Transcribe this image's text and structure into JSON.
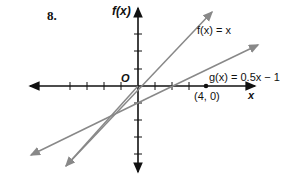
{
  "problem_number": "8.",
  "axes": {
    "y_label": "f(x)",
    "x_label": "x",
    "origin_label": "O"
  },
  "lines": [
    {
      "name": "f",
      "label": "f(x) = x",
      "slope": 1,
      "intercept": 0,
      "color": "#888888"
    },
    {
      "name": "g",
      "label": "g(x) = 0.5x − 1",
      "slope": 0.5,
      "intercept": -1,
      "color": "#888888"
    }
  ],
  "points": [
    {
      "label": "(4, 0)",
      "x": 4,
      "y": 0
    }
  ],
  "grid": {
    "unit_px": 17,
    "x_ticks": [
      -4,
      -3,
      -2,
      -1,
      1,
      2,
      3,
      4
    ],
    "y_ticks": [
      -4,
      -3,
      -2,
      -1,
      1,
      2,
      3
    ]
  }
}
